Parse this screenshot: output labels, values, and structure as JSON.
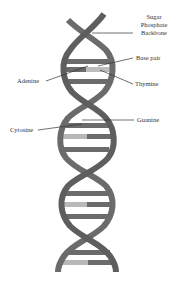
{
  "diagram": {
    "colors": {
      "backbone": "#6b6b6b",
      "backbone_dark": "#555555",
      "base_dark": "#707070",
      "base_light": "#b8b8b8",
      "leader_line": "#333333",
      "text": "#333333"
    },
    "labels": {
      "sugar_phosphate_backbone": [
        "Sugar",
        "Phosphate",
        "Backbone"
      ],
      "base_pair": "Base pair",
      "adenine": "Adenine",
      "thymine": "Thymine",
      "cytosine": "Cytosine",
      "guanine": "Guanine"
    }
  }
}
